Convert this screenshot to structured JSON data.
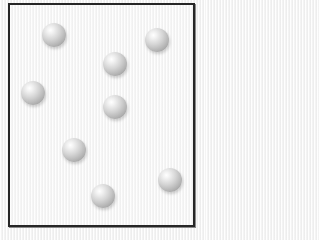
{
  "diagram": {
    "type": "particles-in-container",
    "container": {
      "left": 8,
      "top": 3,
      "right": 194,
      "bottom": 226,
      "border_color": "#262626",
      "fill_color": "#f6f6f6"
    },
    "particle_style": {
      "radius": 12,
      "highlight_color": "#ffffff",
      "shadow_color": "#9a9a9a"
    },
    "particles": [
      {
        "cx": 54,
        "cy": 35
      },
      {
        "cx": 157,
        "cy": 40
      },
      {
        "cx": 115,
        "cy": 64
      },
      {
        "cx": 33,
        "cy": 93
      },
      {
        "cx": 115,
        "cy": 107
      },
      {
        "cx": 74,
        "cy": 150
      },
      {
        "cx": 170,
        "cy": 180
      },
      {
        "cx": 103,
        "cy": 196
      }
    ],
    "particle_count": 8
  }
}
